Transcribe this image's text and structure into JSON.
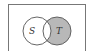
{
  "diagram": {
    "type": "venn",
    "universe_box": true,
    "sets": [
      {
        "label": "S",
        "shaded": false
      },
      {
        "label": "T",
        "shaded": true
      }
    ],
    "shaded_region": "T minus S",
    "colors": {
      "shade": "#b8b8b8",
      "stroke": "#555555",
      "background": "#ffffff"
    }
  }
}
